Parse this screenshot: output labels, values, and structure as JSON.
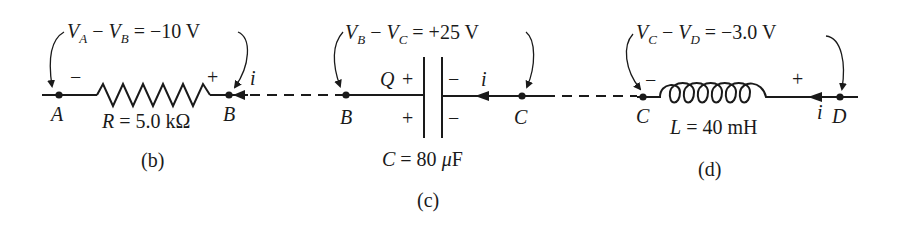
{
  "diagram": {
    "panels": [
      {
        "id": "b",
        "caption": "(b)",
        "element": "resistor",
        "voltage_label": {
          "v1": "V",
          "s1": "A",
          "minus": " − ",
          "v2": "V",
          "s2": "B",
          "rest": " = −10 V"
        },
        "value_label": {
          "sym": "R",
          "rest": " = 5.0 kΩ"
        },
        "node_left": "A",
        "node_right": "B",
        "polarity_left": "−",
        "polarity_right": "+",
        "current": "i"
      },
      {
        "id": "c",
        "caption": "(c)",
        "element": "capacitor",
        "voltage_label": {
          "v1": "V",
          "s1": "B",
          "minus": " − ",
          "v2": "V",
          "s2": "C",
          "rest": " = +25 V"
        },
        "value_label": {
          "sym": "C",
          "rest": " = 80 ",
          "mu": "μ",
          "unit": "F"
        },
        "node_left": "B",
        "node_right": "C",
        "charge": "Q",
        "polarity_left_top": "+",
        "polarity_left_bottom": "+",
        "polarity_right_top": "−",
        "polarity_right_bottom": "−",
        "current": "i"
      },
      {
        "id": "d",
        "caption": "(d)",
        "element": "inductor",
        "voltage_label": {
          "v1": "V",
          "s1": "C",
          "minus": " − ",
          "v2": "V",
          "s2": "D",
          "rest": " = −3.0 V"
        },
        "value_label": {
          "sym": "L",
          "rest": " = 40 mH"
        },
        "node_left": "C",
        "node_right": "D",
        "polarity_left": "−",
        "polarity_right": "+",
        "current": "i"
      }
    ]
  }
}
